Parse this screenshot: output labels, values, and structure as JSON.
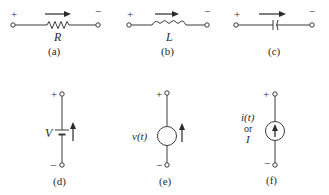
{
  "figure": {
    "elements": [
      {
        "id": "a",
        "kind": "resistor",
        "symbol_label": "R",
        "caption": "(a)",
        "plus": "+",
        "minus": "−"
      },
      {
        "id": "b",
        "kind": "inductor",
        "symbol_label": "L",
        "caption": "(b)",
        "plus": "+",
        "minus": "−"
      },
      {
        "id": "c",
        "kind": "capacitor",
        "symbol_label": "",
        "caption": "(c)",
        "plus": "+",
        "minus": "−"
      },
      {
        "id": "d",
        "kind": "dc-voltage-source",
        "symbol_label": "V",
        "caption": "(d)",
        "plus": "+",
        "minus": "−"
      },
      {
        "id": "e",
        "kind": "voltage-source",
        "symbol_label": "v(t)",
        "caption": "(e)",
        "plus": "+",
        "minus": "−"
      },
      {
        "id": "f",
        "kind": "current-source",
        "symbol_label_line1": "i(t)",
        "symbol_label_line2": "or",
        "symbol_label_line3": "I",
        "caption": "(f)",
        "plus": "+",
        "minus": "−"
      }
    ]
  },
  "colors": {
    "ink": "#2a2a2a",
    "background": "#ffffff"
  }
}
